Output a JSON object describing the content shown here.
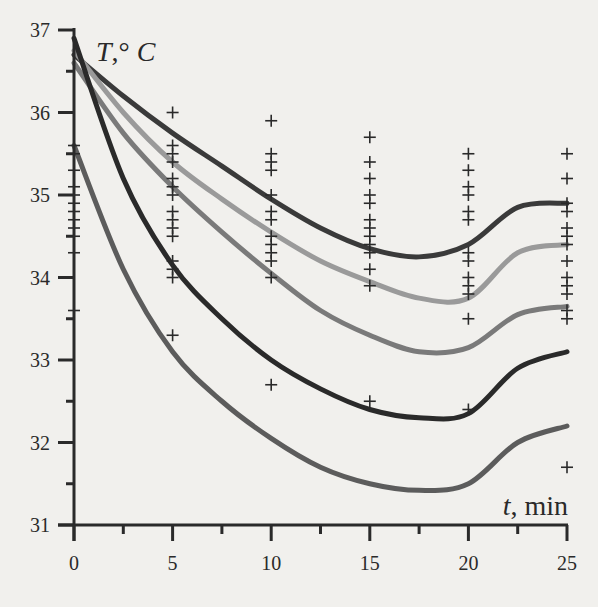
{
  "chart_data": {
    "type": "line",
    "title": "",
    "xlabel": "t, min",
    "ylabel": "T,° C",
    "xlim": [
      0,
      25
    ],
    "ylim": [
      31,
      37
    ],
    "grid": false,
    "legend": null,
    "x_ticks": [
      0,
      5,
      10,
      15,
      20,
      25
    ],
    "x_minor_ticks": [
      2.5,
      7.5,
      12.5,
      17.5,
      22.5
    ],
    "y_ticks": [
      31,
      32,
      33,
      34,
      35,
      36,
      37
    ],
    "y_minor_ticks": [
      31.5,
      32.5,
      33.5,
      34.5,
      35.5,
      36.5
    ],
    "x": [
      0,
      2.5,
      5,
      7.5,
      10,
      12.5,
      15,
      17.5,
      20,
      22.5,
      25
    ],
    "series": [
      {
        "name": "curve-1",
        "color": "#3a3a3a",
        "width": 5,
        "values": [
          36.7,
          36.2,
          35.75,
          35.35,
          34.95,
          34.6,
          34.35,
          34.25,
          34.4,
          34.85,
          34.9
        ]
      },
      {
        "name": "curve-2",
        "color": "#9a9a9a",
        "width": 5,
        "values": [
          36.75,
          36.0,
          35.4,
          34.95,
          34.55,
          34.2,
          33.95,
          33.75,
          33.75,
          34.3,
          34.4
        ]
      },
      {
        "name": "curve-3",
        "color": "#7a7a7a",
        "width": 5,
        "values": [
          36.6,
          35.75,
          35.1,
          34.55,
          34.05,
          33.6,
          33.3,
          33.1,
          33.15,
          33.55,
          33.65
        ]
      },
      {
        "name": "curve-4",
        "color": "#2a2a2a",
        "width": 5,
        "values": [
          36.9,
          35.2,
          34.15,
          33.5,
          33.0,
          32.65,
          32.4,
          32.3,
          32.35,
          32.9,
          33.1
        ]
      },
      {
        "name": "curve-5",
        "color": "#5c5c5c",
        "width": 5,
        "values": [
          35.6,
          34.1,
          33.1,
          32.5,
          32.05,
          31.7,
          31.5,
          31.42,
          31.5,
          32.0,
          32.2
        ]
      }
    ],
    "scatter": {
      "name": "measurements",
      "marker": "+",
      "points": [
        {
          "t": 0,
          "T": [
            35.6,
            35.5,
            35.3,
            35.1,
            35.0,
            34.9,
            34.8,
            34.7,
            34.6,
            34.5,
            34.3,
            33.6
          ]
        },
        {
          "t": 5,
          "T": [
            36.0,
            35.6,
            35.5,
            35.4,
            35.2,
            35.1,
            35.0,
            34.8,
            34.7,
            34.6,
            34.5,
            34.2,
            34.1,
            34.0,
            33.3
          ]
        },
        {
          "t": 10,
          "T": [
            35.9,
            35.5,
            35.4,
            35.3,
            35.0,
            34.8,
            34.7,
            34.5,
            34.4,
            34.3,
            34.2,
            34.0,
            32.7
          ]
        },
        {
          "t": 15,
          "T": [
            35.7,
            35.4,
            35.2,
            35.0,
            34.9,
            34.7,
            34.6,
            34.5,
            34.4,
            34.3,
            34.1,
            33.9,
            32.5
          ]
        },
        {
          "t": 20,
          "T": [
            35.5,
            35.3,
            35.1,
            35.0,
            34.8,
            34.7,
            34.3,
            34.2,
            34.0,
            33.9,
            33.8,
            33.5,
            32.4
          ]
        },
        {
          "t": 25,
          "T": [
            35.5,
            35.2,
            34.9,
            34.8,
            34.6,
            34.5,
            34.4,
            34.2,
            34.0,
            33.9,
            33.8,
            33.6,
            33.5,
            31.7
          ]
        }
      ]
    }
  },
  "axes": {
    "x_label_var": "t",
    "x_label_unit": ", min",
    "y_label_var": "T",
    "y_label_unit": ",° ",
    "y_label_unit_var": "C",
    "x_tick_labels": [
      "0",
      "5",
      "10",
      "15",
      "20",
      "25"
    ],
    "y_tick_labels": [
      "31",
      "32",
      "33",
      "34",
      "35",
      "36",
      "37"
    ]
  },
  "colors": {
    "background": "#f1f0ed",
    "axis": "#2a2a2a",
    "marker": "#2a2a2a"
  }
}
